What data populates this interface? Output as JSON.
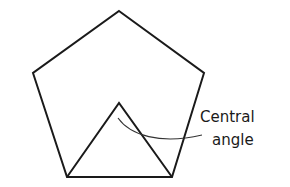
{
  "diagram": {
    "label_line1": "Central",
    "label_line2": "angle",
    "colors": {
      "stroke": "#1a1a1a",
      "background": "#ffffff"
    }
  }
}
